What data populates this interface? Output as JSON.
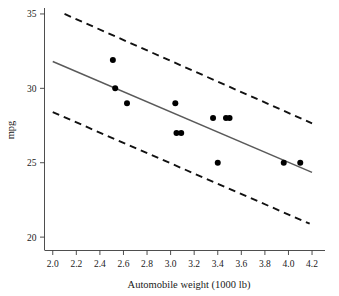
{
  "chart_data": {
    "type": "scatter",
    "title": "",
    "subtitle": "",
    "xlabel": "Automobile weight (1000 lb)",
    "ylabel": "mpg",
    "xlim": [
      1.93,
      4.31
    ],
    "ylim": [
      19.1,
      35.4
    ],
    "grid": false,
    "legend_position": "none",
    "x_ticks": [
      2.0,
      2.2,
      2.4,
      2.6,
      2.8,
      3.0,
      3.2,
      3.4,
      3.6,
      3.8,
      4.0,
      4.2
    ],
    "x_tick_labels": [
      "2.0",
      "2.2",
      "2.4",
      "2.6",
      "2.8",
      "3.0",
      "3.2",
      "3.4",
      "3.6",
      "3.8",
      "4.0",
      "4.2"
    ],
    "y_ticks": [
      20,
      25,
      30,
      35
    ],
    "y_tick_labels": [
      "20",
      "25",
      "30",
      "35"
    ],
    "points": [
      {
        "x": 2.51,
        "y": 31.9
      },
      {
        "x": 2.53,
        "y": 30.0
      },
      {
        "x": 2.63,
        "y": 29.0
      },
      {
        "x": 3.04,
        "y": 29.0
      },
      {
        "x": 3.05,
        "y": 27.0
      },
      {
        "x": 3.09,
        "y": 27.0
      },
      {
        "x": 3.36,
        "y": 28.0
      },
      {
        "x": 3.47,
        "y": 28.0
      },
      {
        "x": 3.5,
        "y": 28.0
      },
      {
        "x": 3.4,
        "y": 25.0
      },
      {
        "x": 3.96,
        "y": 25.0
      },
      {
        "x": 4.1,
        "y": 25.0
      }
    ],
    "series": [
      {
        "name": "fitted regression line",
        "style": "solid",
        "color": "#5a5a5a",
        "x": [
          2.0,
          4.2
        ],
        "values": [
          31.8,
          24.35
        ]
      },
      {
        "name": "upper prediction band",
        "style": "dashed",
        "color": "#111111",
        "x": [
          2.1,
          4.2
        ],
        "values": [
          35.0,
          27.65
        ]
      },
      {
        "name": "lower prediction band",
        "style": "dashed",
        "color": "#111111",
        "x": [
          2.0,
          4.18
        ],
        "values": [
          28.4,
          20.9
        ]
      }
    ],
    "point_color": "#000000",
    "point_size": 3
  },
  "axes": {
    "x_axis_name": "Automobile weight (1000 lb)",
    "y_axis_name": "mpg"
  }
}
